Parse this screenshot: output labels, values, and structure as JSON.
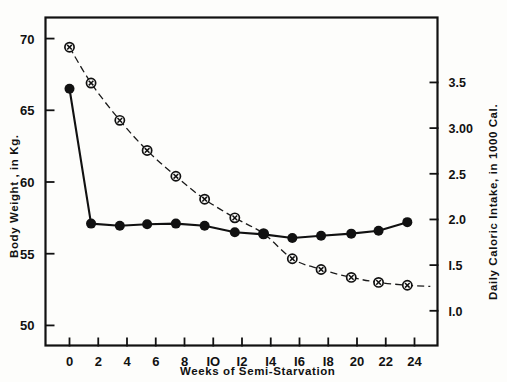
{
  "chart_data": {
    "type": "line",
    "title": "",
    "xlabel": "Weeks  of  Semi-Starvation",
    "ylabel": "Body Weight , in Kg.",
    "ylabel_right": "Daily Caloric Intake, in 1000 Cal.",
    "xlim": [
      -1.6,
      25.6
    ],
    "ylim": [
      48.6,
      71.4
    ],
    "ylim_right": [
      0.62,
      4.2
    ],
    "grid": false,
    "legend": "none",
    "xticks": [
      0,
      2,
      4,
      6,
      8,
      10,
      12,
      14,
      16,
      18,
      20,
      22,
      24
    ],
    "xticklabels": [
      "0",
      "2",
      "4",
      "6",
      "8",
      "IO",
      "I2",
      "I4",
      "I6",
      "I8",
      "20",
      "22",
      "24"
    ],
    "yticks": [
      50,
      55,
      60,
      65,
      70
    ],
    "yticklabels": [
      "50",
      "55",
      "60",
      "65",
      "70"
    ],
    "yticks_right": [
      1.0,
      1.5,
      2.0,
      2.5,
      3.0,
      3.5
    ],
    "yticklabels_right": [
      "I.0",
      "I.5",
      "2.0",
      "2.5",
      "3.00",
      "3.5"
    ],
    "series": [
      {
        "name": "Body Weight",
        "marker": "filled-circle",
        "linestyle": "solid",
        "axis": "left",
        "x": [
          0,
          1.5,
          3.5,
          5.4,
          7.4,
          9.4,
          11.5,
          13.5,
          15.5,
          17.5,
          19.6,
          21.5,
          23.5
        ],
        "y": [
          66.5,
          57.1,
          56.95,
          57.05,
          57.1,
          56.95,
          56.5,
          56.35,
          56.1,
          56.25,
          56.4,
          56.6,
          57.2
        ]
      },
      {
        "name": "Daily Caloric Intake",
        "marker": "crossed-circle",
        "linestyle": "dashed",
        "axis": "right",
        "x": [
          0,
          1.5,
          3.5,
          5.4,
          7.4,
          9.4,
          11.5,
          13.5,
          15.5,
          17.5,
          19.6,
          21.5,
          23.5
        ],
        "y_kg_scale": [
          69.4,
          66.9,
          64.3,
          62.2,
          60.4,
          58.8,
          57.5,
          56.4,
          54.65,
          53.9,
          53.35,
          53.0,
          52.8
        ],
        "y": [
          3.45,
          3.06,
          2.65,
          2.32,
          2.04,
          1.79,
          1.58,
          1.41,
          1.13,
          1.01,
          0.93,
          0.87,
          0.84
        ]
      }
    ]
  }
}
